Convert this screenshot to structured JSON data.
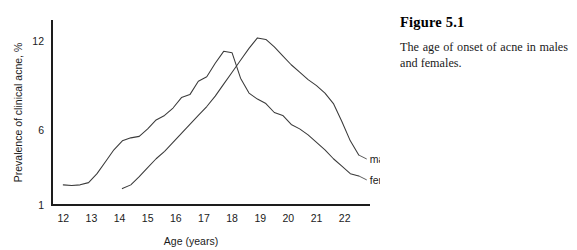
{
  "figure": {
    "title": "Figure 5.1",
    "caption": "The age of onset of acne in males and females."
  },
  "chart_data": {
    "type": "line",
    "title": "",
    "xlabel": "Age (years)",
    "ylabel": "Prevalence of clinical acne, %",
    "xlim": [
      11.6,
      22.9
    ],
    "ylim": [
      1.0,
      13.4
    ],
    "xticks": [
      12,
      13,
      14,
      15,
      16,
      17,
      18,
      19,
      20,
      21,
      22
    ],
    "xticklabels": [
      "12",
      "13",
      "14",
      "15",
      "16",
      "17",
      "18",
      "19",
      "20",
      "21",
      "22"
    ],
    "yticks": [
      1,
      6,
      12
    ],
    "yticklabels": [
      "1",
      "6",
      "12"
    ],
    "grid": false,
    "legend_position": "inline-right-end",
    "series": [
      {
        "name": "females",
        "label": "females",
        "color": "#3a3a3a",
        "x": [
          12.0,
          12.3,
          12.6,
          12.9,
          13.2,
          13.5,
          13.8,
          14.1,
          14.4,
          14.7,
          15.0,
          15.3,
          15.6,
          15.9,
          16.2,
          16.5,
          16.8,
          17.1,
          17.4,
          17.7,
          18.0,
          18.3,
          18.6,
          18.9,
          19.2,
          19.5,
          19.8,
          20.1,
          20.4,
          20.7,
          21.0,
          21.3,
          21.6,
          21.9,
          22.2,
          22.5
        ],
        "y": [
          2.35,
          2.3,
          2.35,
          2.5,
          3.1,
          3.9,
          4.7,
          5.3,
          5.5,
          5.6,
          6.1,
          6.7,
          7.0,
          7.5,
          8.2,
          8.4,
          9.3,
          9.6,
          10.5,
          11.3,
          11.2,
          9.5,
          8.5,
          8.1,
          7.8,
          7.2,
          7.0,
          6.4,
          6.1,
          5.7,
          5.2,
          4.7,
          4.1,
          3.6,
          3.1,
          2.95
        ]
      },
      {
        "name": "males",
        "label": "males",
        "color": "#3a3a3a",
        "x": [
          14.1,
          14.4,
          14.7,
          15.0,
          15.3,
          15.6,
          15.9,
          16.2,
          16.5,
          16.8,
          17.1,
          17.4,
          17.7,
          18.0,
          18.3,
          18.6,
          18.9,
          19.2,
          19.5,
          19.8,
          20.1,
          20.4,
          20.7,
          21.0,
          21.3,
          21.6,
          21.9,
          22.2,
          22.5
        ],
        "y": [
          2.1,
          2.35,
          2.9,
          3.5,
          4.1,
          4.6,
          5.2,
          5.8,
          6.4,
          7.0,
          7.6,
          8.3,
          9.1,
          9.9,
          10.7,
          11.5,
          12.2,
          12.1,
          11.6,
          11.0,
          10.4,
          9.9,
          9.4,
          9.0,
          8.5,
          7.8,
          6.6,
          5.3,
          4.35
        ]
      }
    ]
  }
}
